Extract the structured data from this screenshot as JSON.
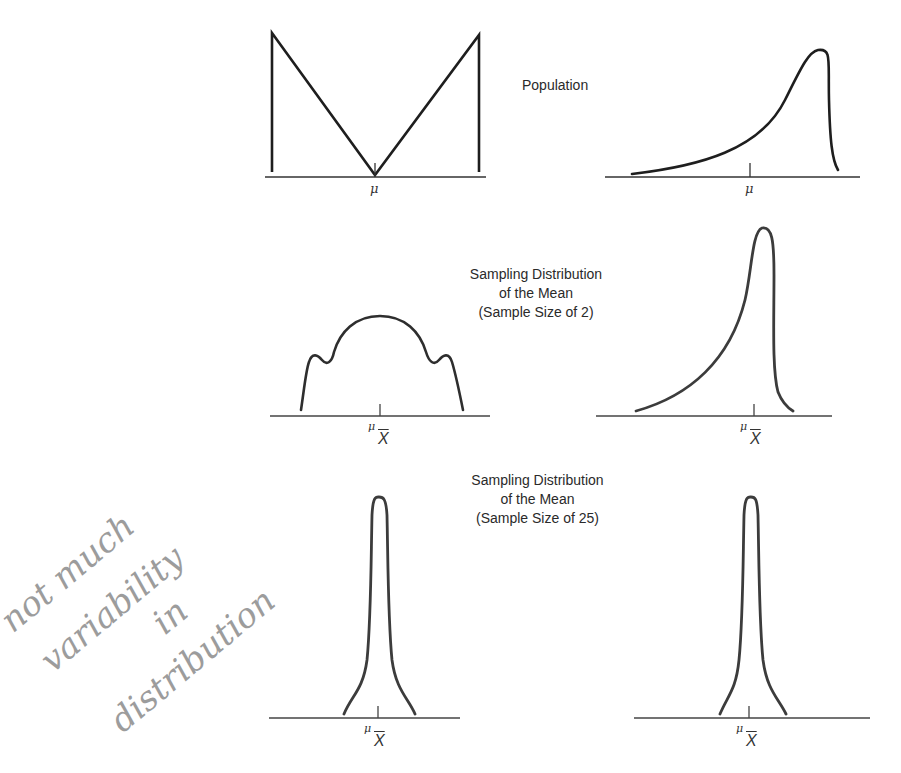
{
  "figure": {
    "rows": [
      {
        "id": "population",
        "caption_lines": [
          "Population"
        ],
        "panels": [
          {
            "shape": "bimodal-V (U-shaped population)",
            "axis_label": "μ"
          },
          {
            "shape": "left-skewed",
            "axis_label": "μ"
          }
        ]
      },
      {
        "id": "sample-size-2",
        "caption_lines": [
          "Sampling Distribution",
          "of the Mean",
          "(Sample Size of 2)"
        ],
        "panels": [
          {
            "shape": "dome with side shoulders",
            "axis_label_main": "μ",
            "axis_label_sub": "X"
          },
          {
            "shape": "left-skewed, narrower",
            "axis_label_main": "μ",
            "axis_label_sub": "X"
          }
        ]
      },
      {
        "id": "sample-size-25",
        "caption_lines": [
          "Sampling Distribution",
          "of the Mean",
          "(Sample Size of 25)"
        ],
        "panels": [
          {
            "shape": "narrow near-normal",
            "axis_label_main": "μ",
            "axis_label_sub": "X"
          },
          {
            "shape": "narrow near-normal",
            "axis_label_main": "μ",
            "axis_label_sub": "X"
          }
        ]
      }
    ],
    "handwritten_note": [
      "not much",
      "variability",
      "in",
      "distribution"
    ],
    "colors": {
      "ink": "#1e1e1e",
      "curve_gray": "#3c3c3c",
      "pencil": "#a0a0a0"
    }
  }
}
